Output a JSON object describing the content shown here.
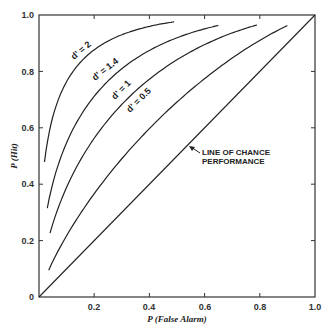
{
  "chart_data": {
    "type": "line",
    "title": "",
    "xlabel": "P (False Alarm)",
    "ylabel": "P (Hit)",
    "xlim": [
      0,
      1.0
    ],
    "ylim": [
      0,
      1.0
    ],
    "grid": false,
    "xticks": [
      "0.2",
      "0.4",
      "0.6",
      "0.8",
      "1.0"
    ],
    "yticks": [
      "0",
      "0.2",
      "0.4",
      "0.6",
      "0.8",
      "1.0"
    ],
    "series": [
      {
        "name": "d' = 2",
        "d_prime": 2,
        "x_range": [
          0.02,
          0.49
        ],
        "x": [
          0.02,
          0.05,
          0.1,
          0.2,
          0.3,
          0.4,
          0.49
        ],
        "y": [
          0.5,
          0.64,
          0.76,
          0.88,
          0.94,
          0.97,
          0.98
        ]
      },
      {
        "name": "d' = 1.4",
        "d_prime": 1.4,
        "x_range": [
          0.03,
          0.65
        ],
        "x": [
          0.03,
          0.05,
          0.1,
          0.2,
          0.3,
          0.4,
          0.5,
          0.65
        ],
        "y": [
          0.27,
          0.36,
          0.49,
          0.66,
          0.77,
          0.85,
          0.9,
          0.96
        ]
      },
      {
        "name": "d' = 1",
        "d_prime": 1,
        "x_range": [
          0.04,
          0.79
        ],
        "x": [
          0.04,
          0.1,
          0.2,
          0.3,
          0.4,
          0.5,
          0.6,
          0.79
        ],
        "y": [
          0.17,
          0.33,
          0.5,
          0.62,
          0.72,
          0.8,
          0.86,
          0.96
        ]
      },
      {
        "name": "d' = 0.5",
        "d_prime": 0.5,
        "x_range": [
          0.035,
          0.9
        ],
        "x": [
          0.035,
          0.1,
          0.2,
          0.3,
          0.4,
          0.5,
          0.6,
          0.7,
          0.8,
          0.9
        ],
        "y": [
          0.08,
          0.19,
          0.31,
          0.43,
          0.53,
          0.62,
          0.71,
          0.79,
          0.87,
          0.95
        ]
      },
      {
        "name": "Line of chance performance",
        "d_prime": 0,
        "x": [
          0,
          1
        ],
        "y": [
          0,
          1
        ]
      }
    ],
    "annotations": [
      {
        "text": "LINE OF CHANCE PERFORMANCE",
        "x": 0.56,
        "y": 0.49,
        "arrow_to": [
          0.51,
          0.52
        ]
      }
    ]
  },
  "labels": {
    "x_axis_title": "P (False Alarm)",
    "y_axis_title": "P (Hit)",
    "annotation_line1": "LINE OF CHANCE",
    "annotation_line2": "PERFORMANCE",
    "curve_d2": "d' = 2",
    "curve_d14": "d' = 1.4",
    "curve_d1": "d' = 1",
    "curve_d05": "d' = 0.5",
    "x_ticks": [
      "0.2",
      "0.4",
      "0.6",
      "0.8",
      "1.0"
    ],
    "y_ticks": [
      "0",
      "0.2",
      "0.4",
      "0.6",
      "0.8",
      "1.0"
    ]
  }
}
